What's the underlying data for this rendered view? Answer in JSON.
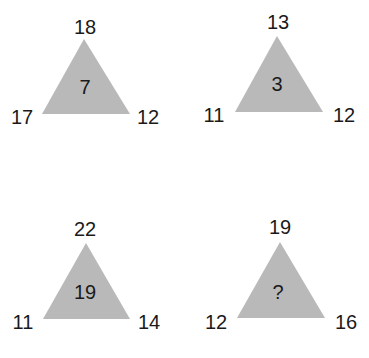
{
  "puzzle": {
    "triangle_color": "#b9b9b9",
    "text_color": "#1a1a1a",
    "triangles": [
      {
        "top": "18",
        "left": "17",
        "right": "12",
        "center": "7"
      },
      {
        "top": "13",
        "left": "11",
        "right": "12",
        "center": "3"
      },
      {
        "top": "22",
        "left": "11",
        "right": "14",
        "center": "19"
      },
      {
        "top": "19",
        "left": "12",
        "right": "16",
        "center": "?"
      }
    ]
  }
}
